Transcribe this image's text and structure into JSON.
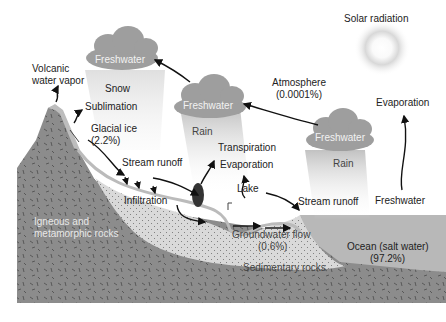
{
  "diagram": {
    "labels": {
      "solar_radiation": "Solar radiation",
      "atmosphere": "Atmosphere",
      "atmosphere_pct": "(0.0001%)",
      "volcanic_line1": "Volcanic",
      "volcanic_line2": "water vapor",
      "snow": "Snow",
      "sublimation": "Sublimation",
      "glacial_ice": "Glacial ice",
      "glacial_ice_pct": "(2.2%)",
      "stream_runoff_left": "Stream runoff",
      "stream_runoff_right": "Stream runoff",
      "infiltration": "Infiltration",
      "transpiration": "Transpiration",
      "evaporation_center": "Evaporation",
      "evaporation_right": "Evaporation",
      "lake": "Lake",
      "rain_center": "Rain",
      "rain_right": "Rain",
      "freshwater_ocean": "Freshwater",
      "groundwater_flow": "Groundwater flow",
      "groundwater_pct": "(0.6%)",
      "sedimentary": "Sedimentary rocks",
      "igneous_line1": "Igneous and",
      "igneous_line2": "metamorphic rocks",
      "ocean": "Ocean (salt water)",
      "ocean_pct": "(97.2%)"
    },
    "clouds": [
      {
        "label": "Freshwater",
        "position": "top-left"
      },
      {
        "label": "Freshwater",
        "position": "center"
      },
      {
        "label": "Freshwater",
        "position": "right"
      }
    ],
    "colors": {
      "rock": "#8c8c8c",
      "sediment": "#d6d6d6",
      "ocean": "#b8b8b8",
      "cloud": "#9a9a9a",
      "sun": "#e6e6e6",
      "arrow": "#111111"
    }
  }
}
